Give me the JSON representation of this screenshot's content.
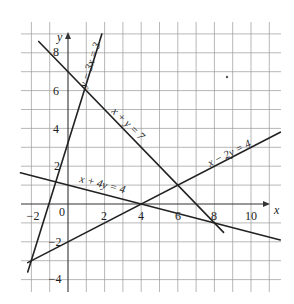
{
  "figure": {
    "x_axis_label": "x",
    "y_axis_label": "y",
    "origin_label": "0",
    "x_ticks": [
      {
        "value": -2,
        "label": "−2"
      },
      {
        "value": 2,
        "label": "2"
      },
      {
        "value": 4,
        "label": "4"
      },
      {
        "value": 6,
        "label": "6"
      },
      {
        "value": 8,
        "label": "8"
      },
      {
        "value": 10,
        "label": "10"
      }
    ],
    "y_ticks": [
      {
        "value": 8,
        "label": "8"
      },
      {
        "value": 6,
        "label": "6"
      },
      {
        "value": 4,
        "label": "4"
      },
      {
        "value": 2,
        "label": "2"
      },
      {
        "value": -2,
        "label": "−2"
      },
      {
        "value": -4,
        "label": "−4"
      }
    ],
    "grid": {
      "x_min": -2.5,
      "x_max": 11.5,
      "y_min": -4.6,
      "y_max": 9.6,
      "step": 1
    },
    "colors": {
      "line": "#222222",
      "grid": "#9a9a9a",
      "axis": "#333333",
      "background": "#ffffff"
    }
  },
  "lines": [
    {
      "equation": "y − 3x = 3",
      "from": [
        -2.2,
        -3.6
      ],
      "to": [
        1.85,
        9.0
      ]
    },
    {
      "equation": "x + y = 7",
      "from": [
        -1.6,
        8.6
      ],
      "to": [
        8.5,
        -1.5
      ]
    },
    {
      "equation": "x − 2y = 4",
      "from": [
        -2.2,
        -3.1
      ],
      "to": [
        11.6,
        3.8
      ]
    },
    {
      "equation": "x + 4y = 4",
      "from": [
        -2.6,
        1.65
      ],
      "to": [
        11.6,
        -1.9
      ]
    }
  ],
  "labels": {
    "line1": "y − 3x = 3",
    "line2": "x + y = 7",
    "line3": "x − 2y = 4",
    "line4": "x + 4y = 4"
  }
}
